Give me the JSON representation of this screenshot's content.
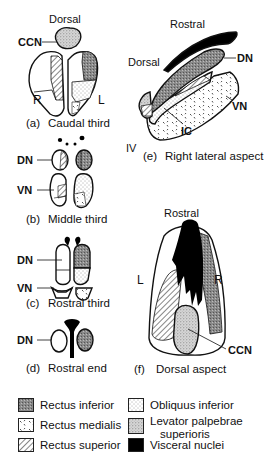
{
  "figure": {
    "panels": [
      {
        "id": "a",
        "letter": "(a)",
        "caption": "Caudal third",
        "labels": {
          "top": "Dorsal",
          "ccn": "CCN",
          "right_side": "R",
          "left_side": "L"
        }
      },
      {
        "id": "b",
        "letter": "(b)",
        "caption": "Middle third",
        "labels": {
          "dn": "DN",
          "vn": "VN"
        }
      },
      {
        "id": "c",
        "letter": "(c)",
        "caption": "Rostral third",
        "labels": {
          "dn": "DN",
          "vn": "VN"
        }
      },
      {
        "id": "d",
        "letter": "(d)",
        "caption": "Rostral end",
        "labels": {
          "dn": "DN"
        }
      },
      {
        "id": "e",
        "letter": "(e)",
        "caption": "Right lateral aspect",
        "labels": {
          "rostral": "Rostral",
          "dorsal": "Dorsal",
          "dn": "DN",
          "vn": "VN",
          "ic": "IC",
          "iv": "IV"
        }
      },
      {
        "id": "f",
        "letter": "(f)",
        "caption": "Dorsal aspect",
        "labels": {
          "rostral": "Rostral",
          "left_side": "L",
          "right_side": "R",
          "ccn": "CCN"
        }
      }
    ]
  },
  "legend": [
    {
      "pattern": "dense-gray",
      "label": "Rectus inferior"
    },
    {
      "pattern": "fine-dots",
      "label": "Obliquus inferior"
    },
    {
      "pattern": "ticks",
      "label": "Rectus medialis"
    },
    {
      "pattern": "stipple-gray",
      "label": "Levator palpebrae",
      "label2": "superioris"
    },
    {
      "pattern": "diagonal-hatch",
      "label": "Rectus superior"
    },
    {
      "pattern": "solid-black",
      "label": "Visceral nuclei"
    }
  ]
}
